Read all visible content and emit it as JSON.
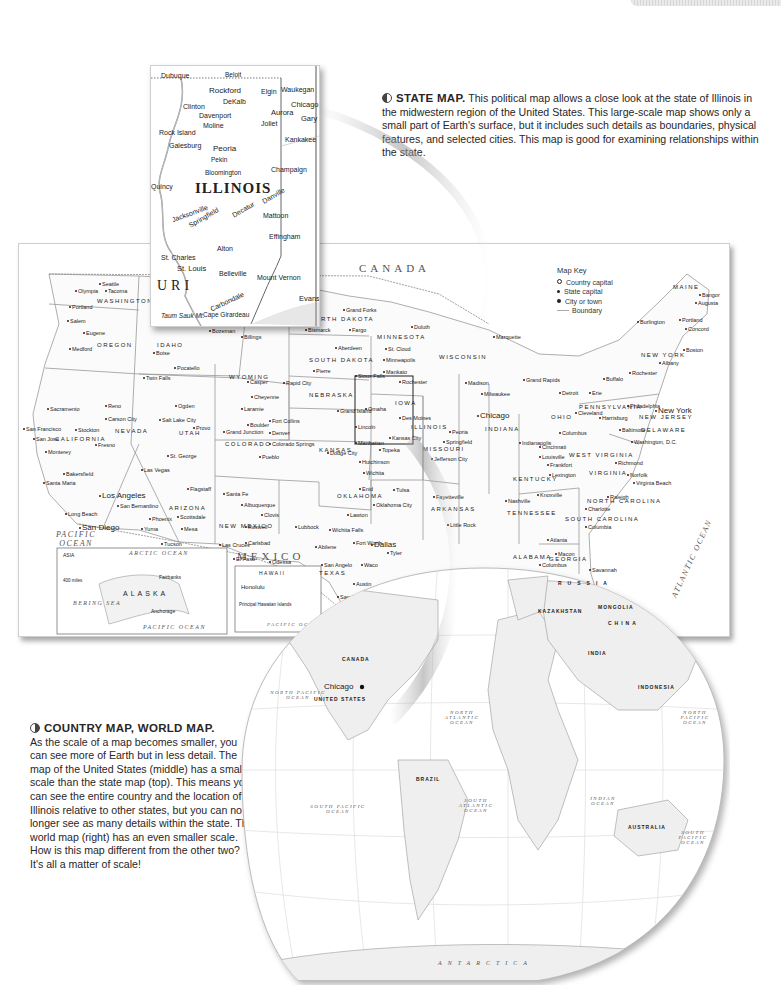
{
  "page": {
    "tab_label": ""
  },
  "captions": {
    "state_map": {
      "heading": "STATE MAP.",
      "body": " This political map allows a close look at the state of Illinois in the midwestern region of the United States. This large-scale map shows only a small part of Earth's surface, but it includes such details as boundaries, physical features, and selected cities. This map is good for examining relationships within the state."
    },
    "country_world_map": {
      "heading": "COUNTRY MAP, WORLD MAP.",
      "body": "As the scale of a map becomes smaller, you can see more of Earth but in less detail. The map of the United States (middle) has a smaller scale than the state map (top). This means you can see the entire country and the location of Illinois relative to other states, but you can no longer see as many details within the state. The world map (right) has an even smaller scale. How is this map different from the other two? It's all a matter of scale!"
    }
  },
  "state_map": {
    "title": "ILLINOIS",
    "labels": [
      "Dubuque",
      "Beloit",
      "Rockford",
      "Elgin",
      "Waukegan",
      "DeKalb",
      "Chicago",
      "Clinton",
      "Davenport",
      "Aurora",
      "Gary",
      "Moline",
      "Joliet",
      "Rock Island",
      "Kankakee",
      "Galesburg",
      "Peoria",
      "Pekin",
      "Bloomington",
      "Champaign",
      "Quincy",
      "Danville",
      "Jacksonville",
      "Springfield",
      "Decatur",
      "Mattoon",
      "Indianapolis",
      "Terre Haute",
      "Effingham",
      "Alton",
      "St. Charles",
      "St. Louis",
      "Belleville",
      "Mount Vernon",
      "Vincennes",
      "Evansville",
      "Carbondale",
      "Cape Girardeau",
      "Cairo",
      "Taum Sauk Mt.",
      "1,772 ft",
      "540 m",
      "URI",
      "IND",
      "K"
    ]
  },
  "us_map": {
    "key": {
      "title": "Map Key",
      "items": [
        "Country capital",
        "State capital",
        "City or town",
        "Boundary"
      ]
    },
    "countries": [
      "CANADA",
      "MEXICO"
    ],
    "oceans": [
      "PACIFIC OCEAN",
      "ATLANTIC OCEAN",
      "GULF OF MEXICO",
      "ARCTIC OCEAN",
      "BERING SEA",
      "PACIFIC OCEAN"
    ],
    "states": [
      "WASHINGTON",
      "OREGON",
      "IDAHO",
      "WYOMING",
      "NEVADA",
      "UTAH",
      "COLORADO",
      "ARIZONA",
      "NEW MEXICO",
      "CALIFORNIA",
      "NORTH DAKOTA",
      "SOUTH DAKOTA",
      "NEBRASKA",
      "KANSAS",
      "OKLAHOMA",
      "TEXAS",
      "MINNESOTA",
      "IOWA",
      "MISSOURI",
      "ARKANSAS",
      "WISCONSIN",
      "ILLINOIS",
      "INDIANA",
      "OHIO",
      "KENTUCKY",
      "TENNESSEE",
      "GEORGIA",
      "ALABAMA",
      "NORTH CAROLINA",
      "SOUTH CAROLINA",
      "VIRGINIA",
      "WEST VIRGINIA",
      "PENNSYLVANIA",
      "NEW YORK",
      "NEW JERSEY",
      "DELAWARE",
      "MAINE",
      "FLORIDA",
      "ALASKA",
      "HAWAII"
    ],
    "cities": [
      {
        "n": "Seattle",
        "x": 80,
        "y": 37
      },
      {
        "n": "Olympia",
        "x": 56,
        "y": 44
      },
      {
        "n": "Tacoma",
        "x": 86,
        "y": 44
      },
      {
        "n": "Portland",
        "x": 50,
        "y": 60
      },
      {
        "n": "Salem",
        "x": 48,
        "y": 74
      },
      {
        "n": "Eugene",
        "x": 64,
        "y": 86
      },
      {
        "n": "Medford",
        "x": 50,
        "y": 102
      },
      {
        "n": "Boise",
        "x": 134,
        "y": 106
      },
      {
        "n": "Butte",
        "x": 168,
        "y": 77
      },
      {
        "n": "Bozeman",
        "x": 190,
        "y": 84
      },
      {
        "n": "Billings",
        "x": 222,
        "y": 90
      },
      {
        "n": "Pocatello",
        "x": 155,
        "y": 121
      },
      {
        "n": "Twin Falls",
        "x": 124,
        "y": 131
      },
      {
        "n": "Casper",
        "x": 228,
        "y": 135
      },
      {
        "n": "Cheyenne",
        "x": 232,
        "y": 150
      },
      {
        "n": "Laramie",
        "x": 222,
        "y": 162
      },
      {
        "n": "Reno",
        "x": 86,
        "y": 159
      },
      {
        "n": "Carson City",
        "x": 86,
        "y": 172
      },
      {
        "n": "Sacramento",
        "x": 28,
        "y": 162
      },
      {
        "n": "San Francisco",
        "x": 4,
        "y": 182
      },
      {
        "n": "San Jose",
        "x": 14,
        "y": 192
      },
      {
        "n": "Stockton",
        "x": 56,
        "y": 183
      },
      {
        "n": "Fresno",
        "x": 76,
        "y": 198
      },
      {
        "n": "Monterey",
        "x": 26,
        "y": 205
      },
      {
        "n": "Bakersfield",
        "x": 44,
        "y": 227
      },
      {
        "n": "Santa Maria",
        "x": 24,
        "y": 236
      },
      {
        "n": "Los Angeles",
        "x": 80,
        "y": 247
      },
      {
        "n": "San Bernardino",
        "x": 98,
        "y": 259
      },
      {
        "n": "Long Beach",
        "x": 46,
        "y": 267
      },
      {
        "n": "San Diego",
        "x": 60,
        "y": 279
      },
      {
        "n": "Las Vegas",
        "x": 122,
        "y": 223
      },
      {
        "n": "St. George",
        "x": 148,
        "y": 209
      },
      {
        "n": "Flagstaff",
        "x": 168,
        "y": 242
      },
      {
        "n": "Phoenix",
        "x": 130,
        "y": 272
      },
      {
        "n": "Scottsdale",
        "x": 158,
        "y": 270
      },
      {
        "n": "Mesa",
        "x": 162,
        "y": 282
      },
      {
        "n": "Yuma",
        "x": 122,
        "y": 282
      },
      {
        "n": "Tucson",
        "x": 142,
        "y": 297
      },
      {
        "n": "Ogden",
        "x": 156,
        "y": 159
      },
      {
        "n": "Salt Lake City",
        "x": 140,
        "y": 173
      },
      {
        "n": "Provo",
        "x": 174,
        "y": 181
      },
      {
        "n": "Grand Junction",
        "x": 204,
        "y": 185
      },
      {
        "n": "Boulder",
        "x": 228,
        "y": 178
      },
      {
        "n": "Fort Collins",
        "x": 250,
        "y": 174
      },
      {
        "n": "Denver",
        "x": 250,
        "y": 186
      },
      {
        "n": "Colorado Springs",
        "x": 250,
        "y": 197
      },
      {
        "n": "Pueblo",
        "x": 240,
        "y": 210
      },
      {
        "n": "Santa Fe",
        "x": 204,
        "y": 247
      },
      {
        "n": "Albuquerque",
        "x": 222,
        "y": 258
      },
      {
        "n": "Clovis",
        "x": 242,
        "y": 268
      },
      {
        "n": "Roswell",
        "x": 226,
        "y": 280
      },
      {
        "n": "Las Cruces",
        "x": 200,
        "y": 298
      },
      {
        "n": "Carlsbad",
        "x": 226,
        "y": 296
      },
      {
        "n": "El Paso",
        "x": 214,
        "y": 312
      },
      {
        "n": "Odessa",
        "x": 250,
        "y": 315
      },
      {
        "n": "Bismarck",
        "x": 286,
        "y": 83
      },
      {
        "n": "Fargo",
        "x": 330,
        "y": 83
      },
      {
        "n": "Grand Forks",
        "x": 324,
        "y": 63
      },
      {
        "n": "Aberdeen",
        "x": 316,
        "y": 101
      },
      {
        "n": "Pierre",
        "x": 294,
        "y": 124
      },
      {
        "n": "Sioux Falls",
        "x": 336,
        "y": 129
      },
      {
        "n": "Rapid City",
        "x": 264,
        "y": 136
      },
      {
        "n": "Omaha",
        "x": 346,
        "y": 162
      },
      {
        "n": "Grand Island",
        "x": 318,
        "y": 164
      },
      {
        "n": "Lincoln",
        "x": 336,
        "y": 180
      },
      {
        "n": "Duluth",
        "x": 392,
        "y": 80
      },
      {
        "n": "Minneapolis",
        "x": 364,
        "y": 113
      },
      {
        "n": "St. Cloud",
        "x": 366,
        "y": 102
      },
      {
        "n": "Mankato",
        "x": 364,
        "y": 125
      },
      {
        "n": "Rochester",
        "x": 380,
        "y": 135
      },
      {
        "n": "Des Moines",
        "x": 380,
        "y": 171
      },
      {
        "n": "Manhattan",
        "x": 336,
        "y": 196
      },
      {
        "n": "Topeka",
        "x": 360,
        "y": 203
      },
      {
        "n": "Kansas City",
        "x": 370,
        "y": 191
      },
      {
        "n": "Hutchinson",
        "x": 340,
        "y": 215
      },
      {
        "n": "Wichita",
        "x": 344,
        "y": 226
      },
      {
        "n": "Dodge City",
        "x": 308,
        "y": 206
      },
      {
        "n": "Tulsa",
        "x": 374,
        "y": 243
      },
      {
        "n": "Oklahoma City",
        "x": 354,
        "y": 258
      },
      {
        "n": "Enid",
        "x": 340,
        "y": 242
      },
      {
        "n": "Lawton",
        "x": 328,
        "y": 268
      },
      {
        "n": "Wichita Falls",
        "x": 310,
        "y": 283
      },
      {
        "n": "Lubbock",
        "x": 276,
        "y": 280
      },
      {
        "n": "Abilene",
        "x": 296,
        "y": 300
      },
      {
        "n": "Fort Worth",
        "x": 334,
        "y": 296
      },
      {
        "n": "Dallas",
        "x": 352,
        "y": 296
      },
      {
        "n": "Tyler",
        "x": 368,
        "y": 306
      },
      {
        "n": "Waco",
        "x": 342,
        "y": 318
      },
      {
        "n": "San Angelo",
        "x": 302,
        "y": 318
      },
      {
        "n": "Austin",
        "x": 334,
        "y": 337
      },
      {
        "n": "San Antonio",
        "x": 318,
        "y": 350
      },
      {
        "n": "Houston",
        "x": 366,
        "y": 350
      },
      {
        "n": "Corpus Christi",
        "x": 350,
        "y": 368
      },
      {
        "n": "Laredo",
        "x": 330,
        "y": 378
      },
      {
        "n": "Brownsville",
        "x": 352,
        "y": 393
      },
      {
        "n": "Chicago",
        "x": 458,
        "y": 167
      },
      {
        "n": "Springfield",
        "x": 424,
        "y": 195
      },
      {
        "n": "Peoria",
        "x": 430,
        "y": 185
      },
      {
        "n": "Jefferson City",
        "x": 412,
        "y": 212
      },
      {
        "n": "Little Rock",
        "x": 428,
        "y": 278
      },
      {
        "n": "Fayetteville",
        "x": 414,
        "y": 250
      },
      {
        "n": "Detroit",
        "x": 540,
        "y": 146
      },
      {
        "n": "Grand Rapids",
        "x": 504,
        "y": 133
      },
      {
        "n": "Marquette",
        "x": 474,
        "y": 90
      },
      {
        "n": "Madison",
        "x": 446,
        "y": 136
      },
      {
        "n": "Milwaukee",
        "x": 462,
        "y": 147
      },
      {
        "n": "Columbus",
        "x": 540,
        "y": 186
      },
      {
        "n": "Cleveland",
        "x": 556,
        "y": 166
      },
      {
        "n": "Cincinnati",
        "x": 520,
        "y": 200
      },
      {
        "n": "Indianapolis",
        "x": 500,
        "y": 196
      },
      {
        "n": "Louisville",
        "x": 520,
        "y": 210
      },
      {
        "n": "Frankfort",
        "x": 528,
        "y": 218
      },
      {
        "n": "Lexington",
        "x": 530,
        "y": 228
      },
      {
        "n": "Nashville",
        "x": 486,
        "y": 254
      },
      {
        "n": "Knoxville",
        "x": 518,
        "y": 248
      },
      {
        "n": "Atlanta",
        "x": 528,
        "y": 293
      },
      {
        "n": "Macon",
        "x": 536,
        "y": 307
      },
      {
        "n": "Columbus",
        "x": 520,
        "y": 318
      },
      {
        "n": "Montgomery",
        "x": 494,
        "y": 328
      },
      {
        "n": "Savannah",
        "x": 570,
        "y": 323
      },
      {
        "n": "Jacksonville",
        "x": 570,
        "y": 354
      },
      {
        "n": "Tallahassee",
        "x": 542,
        "y": 367
      },
      {
        "n": "Orlando",
        "x": 574,
        "y": 380
      },
      {
        "n": "Tampa",
        "x": 544,
        "y": 394
      },
      {
        "n": "St. Petersburg",
        "x": 524,
        "y": 402
      },
      {
        "n": "Charlotte",
        "x": 566,
        "y": 262
      },
      {
        "n": "Raleigh",
        "x": 588,
        "y": 250
      },
      {
        "n": "Columbia",
        "x": 566,
        "y": 280
      },
      {
        "n": "Richmond",
        "x": 596,
        "y": 216
      },
      {
        "n": "Norfolk",
        "x": 608,
        "y": 228
      },
      {
        "n": "Virginia Beach",
        "x": 614,
        "y": 236
      },
      {
        "n": "Washington, D.C.",
        "x": 612,
        "y": 195
      },
      {
        "n": "Baltimore",
        "x": 600,
        "y": 183
      },
      {
        "n": "Philadelphia",
        "x": 608,
        "y": 159
      },
      {
        "n": "Harrisburg",
        "x": 580,
        "y": 171
      },
      {
        "n": "Erie",
        "x": 570,
        "y": 146
      },
      {
        "n": "Buffalo",
        "x": 584,
        "y": 132
      },
      {
        "n": "Rochester",
        "x": 610,
        "y": 126
      },
      {
        "n": "Albany",
        "x": 640,
        "y": 116
      },
      {
        "n": "New York",
        "x": 636,
        "y": 162
      },
      {
        "n": "Boston",
        "x": 664,
        "y": 103
      },
      {
        "n": "Portland",
        "x": 660,
        "y": 73
      },
      {
        "n": "Augusta",
        "x": 676,
        "y": 56
      },
      {
        "n": "Bangor",
        "x": 680,
        "y": 48
      },
      {
        "n": "Burlington",
        "x": 618,
        "y": 75
      },
      {
        "n": "Concord",
        "x": 666,
        "y": 82
      }
    ],
    "insets": {
      "alaska": [
        "ASIA",
        "RUSSIA",
        "Chukchi Sea",
        "ARCTIC OCEAN",
        "North Slope",
        "BROOKS RANGE",
        "ARCTIC CIRCLE",
        "NORTH AMERICA",
        "CANADA",
        "Denali",
        "Fairbanks",
        "ALASKA",
        "Anchorage",
        "Juneau",
        "Gulf of Alaska",
        "Alexander Archipelago",
        "BERING SEA",
        "ALEUTIAN ISLANDS",
        "PACIFIC OCEAN",
        "400 miles",
        "400 kilometers"
      ],
      "hawaii": [
        "HAWAII",
        "Kauai",
        "Ni'ihau",
        "Honolulu",
        "O'ahu",
        "Moloka'i",
        "Lana'i",
        "Maui",
        "Kaho'olawe",
        "Hawai'i",
        "Principal Hawaiian Islands",
        "150 mi",
        "150 km",
        "PACIFIC OCEAN"
      ]
    },
    "scale": [
      "200 miles",
      "200 kilometers",
      "Albers Conic Equal-Area Projection"
    ],
    "north_arrow": "N"
  },
  "world_map": {
    "labels": [
      "RUSSIA",
      "CHINA",
      "INDIA",
      "KAZAKHSTAN",
      "MONGOLIA",
      "INDONESIA",
      "AUSTRALIA",
      "BRAZIL",
      "UNITED STATES",
      "CANADA",
      "Chicago",
      "NORTH PACIFIC OCEAN",
      "NORTH ATLANTIC OCEAN",
      "SOUTH PACIFIC OCEAN",
      "SOUTH ATLANTIC OCEAN",
      "INDIAN OCEAN",
      "NORTH PACIFIC OCEAN",
      "SOUTH PACIFIC OCEAN",
      "ANTARCTICA",
      "NEW ZEALAND"
    ]
  }
}
